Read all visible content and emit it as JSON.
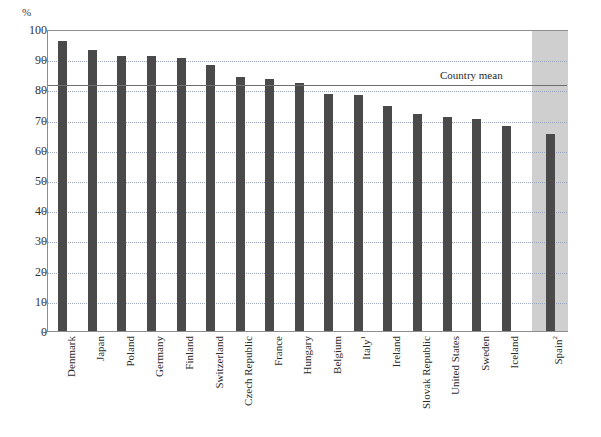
{
  "chart_data": {
    "type": "bar",
    "title": "",
    "subtitle": "",
    "xlabel": "",
    "ylabel": "%",
    "y_unit_label": "%",
    "ylim": [
      0,
      100
    ],
    "ytick_step": 10,
    "ytick_labels": [
      "100",
      "90",
      "80",
      "70",
      "60",
      "50",
      "40",
      "30",
      "20",
      "10",
      "0"
    ],
    "ytick_values": [
      100,
      90,
      80,
      70,
      60,
      50,
      40,
      30,
      20,
      10,
      0
    ],
    "grid": true,
    "grid_style": "dotted",
    "legend_position": "none",
    "categories": [
      "Denmark",
      "Japan",
      "Poland",
      "Germany",
      "Finland",
      "Switzerland",
      "Czech Republic",
      "France",
      "Hungary",
      "Belgium",
      "Italy",
      "Ireland",
      "Slovak Republic",
      "United States",
      "Sweden",
      "Iceland",
      "Spain"
    ],
    "category_footnotes": {
      "Italy": "1",
      "Spain": "2"
    },
    "values": [
      96,
      93,
      91,
      91,
      90.5,
      88,
      84,
      83.5,
      82,
      78.5,
      78,
      74.5,
      72,
      71,
      70.3,
      67.8,
      65.3
    ],
    "annotations": [
      {
        "name": "country-mean",
        "label": "Country mean",
        "value": 82,
        "type": "horizontal-line"
      }
    ],
    "highlighted_category": "Spain",
    "bar_color": "#4a4a4a",
    "highlight_band_color": "#cfcfcf",
    "gridline_color": "#9aa7c0",
    "axis_color": "#8d8d8d",
    "mean_line_color": "#6f6f6f"
  }
}
